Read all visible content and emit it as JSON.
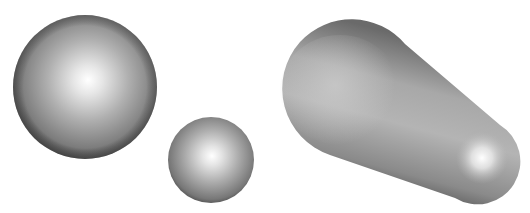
{
  "scene": {
    "description": "Three shaded 3D shapes on white background",
    "background": "#ffffff",
    "shapes": [
      {
        "name": "large-sphere",
        "cx": 85,
        "cy": 87,
        "r": 72,
        "highlight": [
          88,
          80
        ]
      },
      {
        "name": "small-sphere",
        "cx": 211,
        "cy": 160,
        "r": 43,
        "highlight": [
          212,
          156
        ]
      },
      {
        "name": "tapered-capsule",
        "big_end": {
          "cx": 348,
          "cy": 90,
          "r": 70
        },
        "small_end": {
          "cx": 478,
          "cy": 160,
          "r": 40
        },
        "highlight": [
          482,
          158
        ]
      }
    ],
    "colors": {
      "edge": "#4a4a4a",
      "mid": "#9a9a9a",
      "highlight": "#ffffff"
    }
  }
}
